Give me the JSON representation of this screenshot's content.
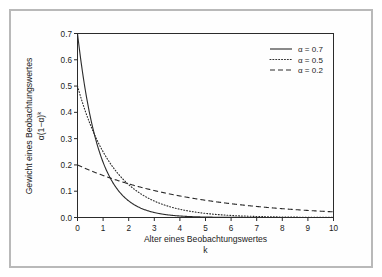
{
  "chart_data": {
    "type": "line",
    "title": "",
    "xlabel": "Alter eines Beobachtungswertes",
    "xlabel_line2": "k",
    "ylabel": "Gewicht eines Beobachtungswertes",
    "ylabel_line2": "α(1−α)",
    "ylabel_line2_exp": "k",
    "xlim": [
      0,
      10
    ],
    "ylim": [
      0.0,
      0.7
    ],
    "grid": false,
    "legend_position": "top-right",
    "xticks": [
      "0",
      "1",
      "2",
      "3",
      "4",
      "5",
      "6",
      "7",
      "8",
      "9",
      "10"
    ],
    "xtick_values": [
      0,
      1,
      2,
      3,
      4,
      5,
      6,
      7,
      8,
      9,
      10
    ],
    "yticks": [
      "0.0",
      "0.1",
      "0.2",
      "0.3",
      "0.4",
      "0.5",
      "0.6",
      "0.7"
    ],
    "ytick_values": [
      0.0,
      0.1,
      0.2,
      0.3,
      0.4,
      0.5,
      0.6,
      0.7
    ],
    "x": [
      0,
      0.25,
      0.5,
      0.75,
      1,
      1.25,
      1.5,
      1.75,
      2,
      2.25,
      2.5,
      2.75,
      3,
      3.25,
      3.5,
      3.75,
      4,
      4.5,
      5,
      5.5,
      6,
      6.5,
      7,
      7.5,
      8,
      8.5,
      9,
      9.5,
      10
    ],
    "series": [
      {
        "name": "α = 0.7",
        "alpha": 0.7,
        "style": "solid",
        "color": "#2b2b2b",
        "values": [
          0.7,
          0.4556,
          0.2965,
          0.193,
          0.1256,
          0.0817,
          0.0532,
          0.0346,
          0.0225,
          0.0147,
          0.0095,
          0.0062,
          0.004,
          0.0026,
          0.0017,
          0.0011,
          0.00073,
          0.00031,
          0.00013,
          6e-05,
          2e-05,
          1e-05,
          4e-06,
          2e-06,
          7e-07,
          3e-07,
          1e-07,
          5e-08,
          2e-08
        ]
      },
      {
        "name": "α = 0.5",
        "alpha": 0.5,
        "style": "dotted",
        "color": "#2b2b2b",
        "values": [
          0.49,
          0.4121,
          0.3465,
          0.2914,
          0.245,
          0.206,
          0.1733,
          0.1457,
          0.1225,
          0.103,
          0.0866,
          0.0729,
          0.0613,
          0.0515,
          0.0433,
          0.0364,
          0.0306,
          0.0217,
          0.0153,
          0.0108,
          0.0077,
          0.0054,
          0.0038,
          0.0027,
          0.0019,
          0.0014,
          0.001,
          0.0007,
          0.0005
        ]
      },
      {
        "name": "α = 0.2",
        "alpha": 0.2,
        "style": "dashed",
        "color": "#2b2b2b",
        "values": [
          0.2,
          0.1892,
          0.1789,
          0.1692,
          0.16,
          0.1513,
          0.1431,
          0.1354,
          0.128,
          0.1211,
          0.1145,
          0.1083,
          0.1024,
          0.0969,
          0.0916,
          0.0866,
          0.0819,
          0.0733,
          0.0655,
          0.0586,
          0.0524,
          0.0469,
          0.0419,
          0.0375,
          0.0336,
          0.03,
          0.0268,
          0.024,
          0.0215
        ]
      }
    ],
    "legend": [
      {
        "label": "α = 0.7",
        "style": "solid"
      },
      {
        "label": "α = 0.5",
        "style": "dotted"
      },
      {
        "label": "α = 0.2",
        "style": "dashed"
      }
    ]
  },
  "frame": {
    "border_color": "#b9b9b9",
    "background": "#ffffff",
    "axis_color": "#2b2b2b"
  }
}
